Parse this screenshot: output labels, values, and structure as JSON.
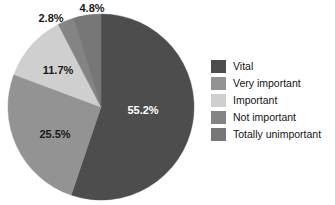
{
  "chart_data": {
    "type": "pie",
    "title": "",
    "xlabel": "",
    "ylabel": "",
    "grid": false,
    "legend_position": "right",
    "start_angle_deg": 0,
    "direction": "clockwise",
    "categories": [
      "Vital",
      "Very important",
      "Important",
      "Not important",
      "Totally unimportant"
    ],
    "values": [
      55.2,
      25.5,
      11.7,
      2.8,
      4.8
    ],
    "value_unit": "%",
    "data_labels": [
      "55.2%",
      "25.5%",
      "11.7%",
      "2.8%",
      "4.8%"
    ],
    "colors": [
      "#4d4d4d",
      "#939393",
      "#cfcfcf",
      "#848484",
      "#777777"
    ],
    "label_colors": [
      "#ffffff",
      "#1a1a1a",
      "#1a1a1a",
      "#1a1a1a",
      "#1a1a1a"
    ],
    "slices": [
      {
        "label": "Vital",
        "value": 55.2,
        "data_label": "55.2%",
        "color": "#4d4d4d",
        "label_color": "#ffffff",
        "label_x": 143,
        "label_y": 111,
        "label_placement": "inside"
      },
      {
        "label": "Very important",
        "value": 25.5,
        "data_label": "25.5%",
        "color": "#939393",
        "label_color": "#1a1a1a",
        "label_x": 55,
        "label_y": 135,
        "label_placement": "inside"
      },
      {
        "label": "Important",
        "value": 11.7,
        "data_label": "11.7%",
        "color": "#cfcfcf",
        "label_color": "#1a1a1a",
        "label_x": 58,
        "label_y": 71,
        "label_placement": "inside"
      },
      {
        "label": "Not important",
        "value": 2.8,
        "data_label": "2.8%",
        "color": "#848484",
        "label_color": "#1a1a1a",
        "label_x": 51,
        "label_y": 19,
        "label_placement": "outside"
      },
      {
        "label": "Totally unimportant",
        "value": 4.8,
        "data_label": "4.8%",
        "color": "#777777",
        "label_color": "#1a1a1a",
        "label_x": 92,
        "label_y": 9,
        "label_placement": "outside"
      }
    ],
    "geometry": {
      "cx": 101,
      "cy": 107,
      "r": 93
    }
  },
  "legend": {
    "items": [
      {
        "label": "Vital",
        "color": "#4d4d4d"
      },
      {
        "label": "Very important",
        "color": "#939393"
      },
      {
        "label": "Important",
        "color": "#cfcfcf"
      },
      {
        "label": "Not important",
        "color": "#848484"
      },
      {
        "label": "Totally unimportant",
        "color": "#777777"
      }
    ]
  }
}
